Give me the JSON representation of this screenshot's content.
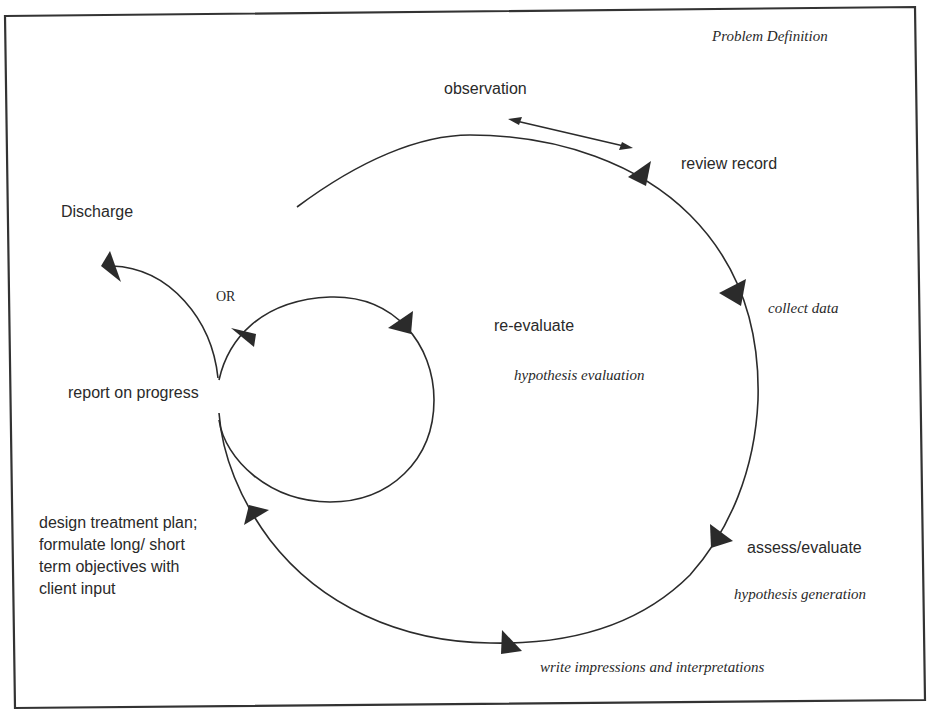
{
  "diagram": {
    "title": "Problem Definition",
    "stroke_color": "#2b2b2b",
    "frame_color": "#333333",
    "labels": {
      "observation": "observation",
      "review_record": "review record",
      "collect_data": "collect data",
      "re_evaluate": "re-evaluate",
      "hypothesis_evaluation": "hypothesis evaluation",
      "assess_evaluate": "assess/evaluate",
      "hypothesis_generation": "hypothesis generation",
      "write_impressions": "write impressions and interpretations",
      "design_treatment": "design treatment plan; formulate long/ short term objectives with client input",
      "report_on_progress": "report on progress",
      "discharge": "Discharge",
      "or": "OR"
    },
    "nodes": [
      {
        "id": "observation",
        "label": "observation"
      },
      {
        "id": "review_record",
        "label": "review record"
      },
      {
        "id": "collect_data",
        "label": "collect data"
      },
      {
        "id": "assess_evaluate",
        "label": "assess/evaluate"
      },
      {
        "id": "write_impressions",
        "label": "write impressions and interpretations"
      },
      {
        "id": "design_treatment",
        "label": "design treatment plan; formulate long/ short term objectives with client input"
      },
      {
        "id": "report_on_progress",
        "label": "report on progress"
      },
      {
        "id": "re_evaluate",
        "label": "re-evaluate"
      },
      {
        "id": "discharge",
        "label": "Discharge"
      }
    ],
    "edges": [
      {
        "from": "observation",
        "to": "review_record",
        "type": "bidirectional"
      },
      {
        "from": "review_record",
        "to": "collect_data",
        "type": "directed"
      },
      {
        "from": "collect_data",
        "to": "assess_evaluate",
        "type": "directed"
      },
      {
        "from": "assess_evaluate",
        "to": "write_impressions",
        "type": "directed"
      },
      {
        "from": "write_impressions",
        "to": "design_treatment",
        "type": "directed"
      },
      {
        "from": "design_treatment",
        "to": "report_on_progress",
        "type": "directed"
      },
      {
        "from": "report_on_progress",
        "to": "re_evaluate",
        "type": "directed",
        "note": "OR"
      },
      {
        "from": "report_on_progress",
        "to": "discharge",
        "type": "directed",
        "note": "OR"
      }
    ],
    "phases": [
      "Problem Definition",
      "hypothesis generation",
      "hypothesis evaluation"
    ]
  }
}
